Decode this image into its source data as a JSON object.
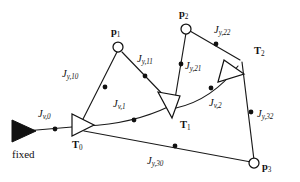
{
  "figure": {
    "type": "factor-graph-kinematic-chain-diagram",
    "background_color": "#ffffff",
    "ink_color": "#111111",
    "anchor_label": "fixed",
    "frames": [
      {
        "id": "T0",
        "name": "T",
        "sub": "0",
        "x": 78,
        "y": 124,
        "rotation_deg": 0,
        "shape": "open-triangle"
      },
      {
        "id": "T1",
        "name": "T",
        "sub": "1",
        "x": 172,
        "y": 108,
        "rotation_deg": 55,
        "shape": "open-triangle"
      },
      {
        "id": "T2",
        "name": "T",
        "sub": "2",
        "x": 240,
        "y": 62,
        "rotation_deg": -42,
        "shape": "open-triangle"
      }
    ],
    "frame_labels": [
      {
        "id": "T0-label",
        "name": "T",
        "sub": "0",
        "x": 75,
        "y": 146
      },
      {
        "id": "T1-label",
        "name": "T",
        "sub": "1",
        "x": 182,
        "y": 126
      },
      {
        "id": "T2-label",
        "name": "T",
        "sub": "2",
        "x": 257,
        "y": 52
      }
    ],
    "points": [
      {
        "id": "p1",
        "name": "p",
        "sub": "1",
        "x": 118,
        "y": 47,
        "label_x": 111,
        "label_y": 33
      },
      {
        "id": "p2",
        "name": "p",
        "sub": "2",
        "x": 186,
        "y": 29,
        "label_x": 179,
        "label_y": 15
      },
      {
        "id": "p3",
        "name": "p",
        "sub": "3",
        "x": 254,
        "y": 163,
        "label_x": 262,
        "label_y": 171
      }
    ],
    "anchor": {
      "id": "fixed-anchor",
      "x": 25,
      "y": 131,
      "label": "fixed",
      "label_x": 12,
      "label_y": 155
    },
    "edges": [
      {
        "id": "edge-anchor-T0",
        "from": "fixed",
        "to": "T0",
        "curved": false
      },
      {
        "id": "edge-T0-p1",
        "from": "T0",
        "to": "p1",
        "curved": false
      },
      {
        "id": "edge-p1-T1",
        "from": "p1",
        "to": "T1",
        "curved": false
      },
      {
        "id": "edge-T0-T1",
        "from": "T0",
        "to": "T1",
        "curved": true
      },
      {
        "id": "edge-p2-T1",
        "from": "p2",
        "to": "T1",
        "curved": false
      },
      {
        "id": "edge-p2-T2",
        "from": "p2",
        "to": "T2",
        "curved": false
      },
      {
        "id": "edge-T1-T2",
        "from": "T1",
        "to": "T2",
        "curved": true
      },
      {
        "id": "edge-T2-p3",
        "from": "T2",
        "to": "p3",
        "curved": false
      },
      {
        "id": "edge-T0-p3",
        "from": "T0",
        "to": "p3",
        "curved": false
      }
    ],
    "factors": [
      {
        "id": "Jv0",
        "name": "J",
        "sub": "v,0",
        "dot_x": 55,
        "dot_y": 129,
        "label_x": 40,
        "label_y": 115
      },
      {
        "id": "Jy10",
        "name": "J",
        "sub": "y,10",
        "dot_x": 105,
        "dot_y": 86,
        "label_x": 66,
        "label_y": 74
      },
      {
        "id": "Jy11",
        "name": "J",
        "sub": "y,11",
        "dot_x": 145,
        "dot_y": 76,
        "label_x": 142,
        "label_y": 60
      },
      {
        "id": "Jv1",
        "name": "J",
        "sub": "v,1",
        "dot_x": 134,
        "dot_y": 118,
        "label_x": 116,
        "label_y": 104
      },
      {
        "id": "Jy21",
        "name": "J",
        "sub": "y,21",
        "dot_x": 180,
        "dot_y": 65,
        "label_x": 185,
        "label_y": 68
      },
      {
        "id": "Jy22",
        "name": "J",
        "sub": "y,22",
        "dot_x": 216,
        "dot_y": 44,
        "label_x": 217,
        "label_y": 31
      },
      {
        "id": "Jv2",
        "name": "J",
        "sub": "v,2",
        "dot_x": 211,
        "dot_y": 88,
        "label_x": 212,
        "label_y": 104
      },
      {
        "id": "Jy32",
        "name": "J",
        "sub": "y,32",
        "dot_x": 250,
        "dot_y": 112,
        "label_x": 258,
        "label_y": 116
      },
      {
        "id": "Jy30",
        "name": "J",
        "sub": "y,30",
        "dot_x": 175,
        "dot_y": 146,
        "label_x": 150,
        "label_y": 162
      }
    ]
  }
}
